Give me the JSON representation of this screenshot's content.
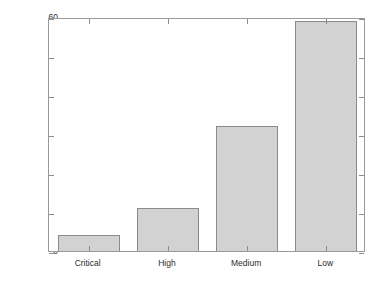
{
  "chart_data": {
    "type": "bar",
    "title": "",
    "subtitle": "",
    "xlabel": "",
    "ylabel": "The Number of Vulnerability",
    "categories": [
      "Critical",
      "High",
      "Medium",
      "Low"
    ],
    "values": [
      4,
      11,
      32,
      59
    ],
    "ylim": [
      0,
      60
    ],
    "ytick_labels": [
      "0",
      "10",
      "20",
      "30",
      "40",
      "50",
      "60"
    ],
    "ytick_values": [
      0,
      10,
      20,
      30,
      40,
      50,
      60
    ],
    "grid": false,
    "legend": null,
    "legend_position": "none",
    "bar_fill_color": "#d2d2d2",
    "bar_edge_color": "#8a8a8a",
    "axis_color": "#9a9a9a",
    "background_color": "#ffffff",
    "text_color": "#2b2b2b"
  }
}
